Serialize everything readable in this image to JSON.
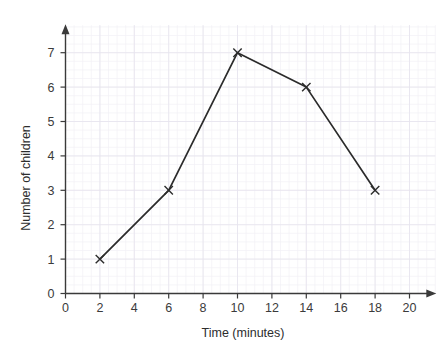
{
  "chart_data": {
    "type": "line",
    "title": "",
    "xlabel": "Time (minutes)",
    "ylabel": "Number of children",
    "x": [
      2,
      6,
      10,
      14,
      18
    ],
    "values": [
      1,
      3,
      7,
      6,
      3
    ],
    "series": [
      {
        "name": "",
        "points": [
          {
            "x": 2,
            "y": 1
          },
          {
            "x": 6,
            "y": 3
          },
          {
            "x": 10,
            "y": 7
          },
          {
            "x": 14,
            "y": 6
          },
          {
            "x": 18,
            "y": 3
          }
        ]
      }
    ],
    "xlim": [
      0,
      21.5
    ],
    "ylim": [
      0,
      7.8
    ],
    "xticks": [
      0,
      2,
      4,
      6,
      8,
      10,
      12,
      14,
      16,
      18,
      20
    ],
    "yticks": [
      0,
      1,
      2,
      3,
      4,
      5,
      6,
      7
    ],
    "xtick_labels": [
      "0",
      "2",
      "4",
      "6",
      "8",
      "10",
      "12",
      "14",
      "16",
      "18",
      "20"
    ],
    "ytick_labels": [
      "0",
      "1",
      "2",
      "3",
      "4",
      "5",
      "6",
      "7"
    ],
    "grid": true,
    "grid_minor": true,
    "legend": false,
    "legend_position": "none",
    "marker": "x",
    "axis_arrows": true,
    "colors": {
      "line": "#2b2b2b",
      "marker": "#2b2b2b",
      "axis": "#3a3a3a",
      "grid_major": "#e6e3ee",
      "grid_minor": "#f2f0f6",
      "text": "#3b3b3b",
      "background": "#ffffff"
    }
  }
}
